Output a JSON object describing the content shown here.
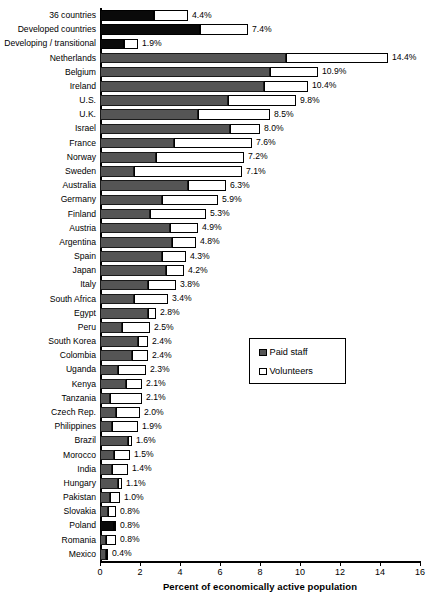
{
  "chart_data": {
    "type": "bar",
    "orientation": "horizontal",
    "stacked": true,
    "title": "",
    "xlabel": "Percent of economically active population",
    "ylabel": "",
    "xlim": [
      0,
      16
    ],
    "xticks": [
      0,
      2,
      4,
      6,
      8,
      10,
      12,
      14,
      16
    ],
    "grid": false,
    "legend_position": "center-right",
    "series": [
      {
        "name": "Paid staff",
        "color": "#555555"
      },
      {
        "name": "Volunteers",
        "color": "#ffffff"
      }
    ],
    "categories": [
      "36 countries",
      "Developed countries",
      "Developing / transitional",
      "Netherlands",
      "Belgium",
      "Ireland",
      "U.S.",
      "U.K.",
      "Israel",
      "France",
      "Norway",
      "Sweden",
      "Australia",
      "Germany",
      "Finland",
      "Austria",
      "Argentina",
      "Spain",
      "Japan",
      "Italy",
      "South Africa",
      "Egypt",
      "Peru",
      "South Korea",
      "Colombia",
      "Uganda",
      "Kenya",
      "Tanzania",
      "Czech Rep.",
      "Philippines",
      "Brazil",
      "Morocco",
      "India",
      "Hungary",
      "Pakistan",
      "Slovakia",
      "Poland",
      "Romania",
      "Mexico"
    ],
    "totals": [
      4.4,
      7.4,
      1.9,
      14.4,
      10.9,
      10.4,
      9.8,
      8.5,
      8.0,
      7.6,
      7.2,
      7.1,
      6.3,
      5.9,
      5.3,
      4.9,
      4.8,
      4.3,
      4.2,
      3.8,
      3.4,
      2.8,
      2.5,
      2.4,
      2.4,
      2.3,
      2.1,
      2.1,
      2.0,
      1.9,
      1.6,
      1.5,
      1.4,
      1.1,
      1.0,
      0.8,
      0.8,
      0.8,
      0.4
    ],
    "paid_staff": [
      2.7,
      5.0,
      1.2,
      9.3,
      8.5,
      8.2,
      6.4,
      4.9,
      6.5,
      3.7,
      2.8,
      1.7,
      4.4,
      3.1,
      2.5,
      3.5,
      3.6,
      3.1,
      3.3,
      2.4,
      1.7,
      2.4,
      1.1,
      1.9,
      1.6,
      0.9,
      1.3,
      0.5,
      0.8,
      0.6,
      1.4,
      0.7,
      0.6,
      0.9,
      0.5,
      0.4,
      0.7,
      0.3,
      0.3
    ],
    "volunteers": [
      1.7,
      2.4,
      0.7,
      5.1,
      2.4,
      2.2,
      3.4,
      3.6,
      1.5,
      3.9,
      4.4,
      5.4,
      1.9,
      2.8,
      2.8,
      1.4,
      1.2,
      1.2,
      0.9,
      1.4,
      1.7,
      0.4,
      1.4,
      0.5,
      0.8,
      1.4,
      0.8,
      1.6,
      1.2,
      1.3,
      0.2,
      0.8,
      0.8,
      0.2,
      0.5,
      0.4,
      0.1,
      0.5,
      0.1
    ],
    "dark_rows": [
      0,
      1,
      2,
      36
    ],
    "value_labels": [
      "4.4%",
      "7.4%",
      "1.9%",
      "14.4%",
      "10.9%",
      "10.4%",
      "9.8%",
      "8.5%",
      "8.0%",
      "7.6%",
      "7.2%",
      "7.1%",
      "6.3%",
      "5.9%",
      "5.3%",
      "4.9%",
      "4.8%",
      "4.3%",
      "4.2%",
      "3.8%",
      "3.4%",
      "2.8%",
      "2.5%",
      "2.4%",
      "2.4%",
      "2.3%",
      "2.1%",
      "2.1%",
      "2.0%",
      "1.9%",
      "1.6%",
      "1.5%",
      "1.4%",
      "1.1%",
      "1.0%",
      "0.8%",
      "0.8%",
      "0.8%",
      "0.4%"
    ],
    "tick_labels": [
      "0",
      "2",
      "4",
      "6",
      "8",
      "10",
      "12",
      "14",
      "16"
    ]
  },
  "legend": {
    "items": [
      {
        "label": "Paid staff"
      },
      {
        "label": "Volunteers"
      }
    ]
  },
  "axis": {
    "xlabel": "Percent of economically active population"
  }
}
